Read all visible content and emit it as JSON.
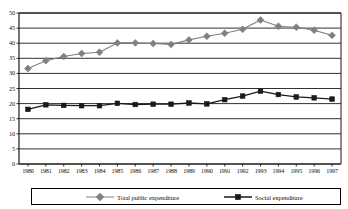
{
  "chart_data": {
    "type": "line",
    "title": "",
    "subtitle": "",
    "xlabel": "",
    "ylabel": "",
    "grid": true,
    "gridlines": "horizontal",
    "legend_position": "bottom",
    "ylim": [
      0,
      50
    ],
    "yticks": [
      0,
      5,
      10,
      15,
      20,
      25,
      30,
      35,
      40,
      45,
      50
    ],
    "categories": [
      "1980",
      "1981",
      "1982",
      "1983",
      "1984",
      "1985",
      "1986",
      "1987",
      "1988",
      "1989",
      "1990",
      "1991",
      "1992",
      "1993",
      "1994",
      "1995",
      "1996",
      "1997"
    ],
    "x": [
      1980,
      1981,
      1982,
      1983,
      1984,
      1985,
      1986,
      1987,
      1988,
      1989,
      1990,
      1991,
      1992,
      1993,
      1994,
      1995,
      1996,
      1997
    ],
    "series": [
      {
        "name": "Total public expenditure",
        "color": "#808080",
        "marker": "diamond",
        "values": [
          31.6,
          34.2,
          35.6,
          36.6,
          37.0,
          40.1,
          40.1,
          39.9,
          39.6,
          41.1,
          42.3,
          43.3,
          44.6,
          47.7,
          45.6,
          45.3,
          44.3,
          42.6
        ]
      },
      {
        "name": "Social expenditure",
        "color": "#1a1a1a",
        "marker": "square",
        "values": [
          18.1,
          19.6,
          19.4,
          19.3,
          19.3,
          20.1,
          19.7,
          19.8,
          19.8,
          20.2,
          19.9,
          21.3,
          22.5,
          24.1,
          23.0,
          22.2,
          21.9,
          21.5
        ]
      }
    ]
  },
  "axis": {
    "y_tick_labels": [
      "50",
      "45",
      "40",
      "35",
      "30",
      "25",
      "20",
      "15",
      "10",
      "5",
      "0"
    ],
    "x_tick_labels": [
      "1980",
      "1981",
      "1982",
      "1983",
      "1984",
      "1985",
      "1986",
      "1987",
      "1988",
      "1989",
      "1990",
      "1991",
      "1992",
      "1993",
      "1994",
      "1995",
      "1996",
      "1997"
    ]
  },
  "legend": {
    "items": [
      {
        "label": "Total public expenditure",
        "color": "#808080",
        "marker": "diamond"
      },
      {
        "label": "Social expenditure",
        "color": "#1a1a1a",
        "marker": "square"
      }
    ]
  }
}
